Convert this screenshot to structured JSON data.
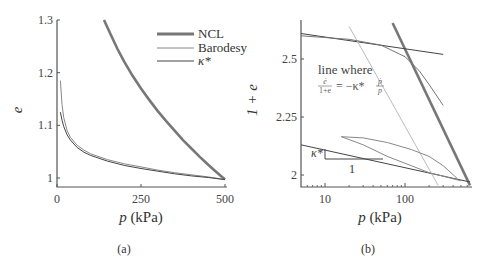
{
  "chart_data": [
    {
      "type": "line",
      "panel": "a",
      "caption": "(a)",
      "xlabel_var": "p",
      "xlabel_unit": " (kPa)",
      "ylabel": "e",
      "xlim": [
        0,
        500
      ],
      "ylim": [
        0.98,
        1.3
      ],
      "xticks": [
        0,
        250,
        500
      ],
      "xtick_labels": [
        "0",
        "250",
        "500"
      ],
      "yticks": [
        1.0,
        1.1,
        1.2,
        1.3
      ],
      "ytick_labels": [
        "1",
        "1.1",
        "1.2",
        "1.3"
      ],
      "legend": {
        "position": "top-right",
        "entries": [
          "NCL",
          "Barodesy",
          "κ*"
        ]
      },
      "series": [
        {
          "name": "NCL",
          "color": "#777777",
          "width": "thick",
          "x": [
            140,
            160,
            180,
            200,
            225,
            250,
            275,
            300,
            325,
            350,
            375,
            400,
            425,
            450,
            475,
            500
          ],
          "y": [
            1.3,
            1.272,
            1.245,
            1.221,
            1.194,
            1.17,
            1.148,
            1.127,
            1.108,
            1.09,
            1.072,
            1.056,
            1.04,
            1.025,
            1.011,
            0.997
          ]
        },
        {
          "name": "Barodesy",
          "color": "#888888",
          "width": "thin",
          "x": [
            10,
            15,
            20,
            30,
            40,
            60,
            80,
            100,
            150,
            200,
            250,
            300,
            350,
            400,
            450,
            500
          ],
          "y": [
            1.185,
            1.14,
            1.115,
            1.09,
            1.077,
            1.062,
            1.053,
            1.046,
            1.035,
            1.027,
            1.021,
            1.015,
            1.01,
            1.006,
            1.002,
            0.997
          ]
        },
        {
          "name": "κ*",
          "color": "#444444",
          "width": "thin",
          "x": [
            10,
            15,
            20,
            30,
            40,
            60,
            80,
            100,
            150,
            200,
            250,
            300,
            350,
            400,
            450,
            500
          ],
          "y": [
            1.125,
            1.11,
            1.098,
            1.082,
            1.072,
            1.058,
            1.049,
            1.043,
            1.032,
            1.024,
            1.018,
            1.013,
            1.008,
            1.004,
            1.001,
            0.997
          ]
        }
      ]
    },
    {
      "type": "line",
      "panel": "b",
      "caption": "(b)",
      "xlabel_var": "p",
      "xlabel_unit": " (kPa)",
      "ylabel": "1 + e",
      "xscale": "log",
      "xlim": [
        5,
        650
      ],
      "ylim": [
        1.95,
        2.65
      ],
      "xticks": [
        10,
        100
      ],
      "xtick_labels": [
        "10",
        "100"
      ],
      "yticks": [
        2.0,
        2.25,
        2.5
      ],
      "ytick_labels": [
        "2",
        "2.25",
        "2.5"
      ],
      "annotation": {
        "line1": "line where",
        "formula_num": "ė",
        "formula_den": "1+e",
        "formula_rhs": "= −κ*",
        "formula_rhs_num": "ṗ",
        "formula_rhs_den": "p"
      },
      "slope_triangle": {
        "vertical_label": "κ*",
        "horizontal_label": "1"
      },
      "series": [
        {
          "name": "NCL",
          "color": "#777777",
          "width": "thick",
          "x": [
            70,
            650
          ],
          "y": [
            2.655,
            1.955
          ]
        },
        {
          "name": "κ* upper",
          "color": "#444444",
          "width": "thin",
          "x": [
            5,
            300
          ],
          "y": [
            2.61,
            2.52
          ]
        },
        {
          "name": "κ* lower",
          "color": "#444444",
          "width": "thin",
          "x": [
            5,
            650
          ],
          "y": [
            2.13,
            1.97
          ]
        },
        {
          "name": "line where ė/(1+e) = −κ* ṗ/p",
          "color": "#bbbbbb",
          "width": "thin",
          "x": [
            20,
            260
          ],
          "y": [
            2.64,
            1.955
          ]
        },
        {
          "name": "Barodesy unloading",
          "color": "#777777",
          "width": "thin",
          "x": [
            5,
            20,
            50,
            100,
            150,
            200,
            300
          ],
          "y": [
            2.6,
            2.585,
            2.56,
            2.51,
            2.45,
            2.39,
            2.3
          ]
        },
        {
          "name": "Barodesy reload upper",
          "color": "#888888",
          "width": "thin",
          "x": [
            16,
            30,
            60,
            120,
            200,
            300,
            450
          ],
          "y": [
            2.165,
            2.16,
            2.14,
            2.11,
            2.08,
            2.04,
            1.985
          ]
        },
        {
          "name": "Barodesy reload lower",
          "color": "#888888",
          "width": "thin",
          "x": [
            16,
            30,
            60,
            120,
            200,
            300,
            500
          ],
          "y": [
            2.165,
            2.13,
            2.08,
            2.04,
            2.01,
            1.995,
            1.975
          ]
        }
      ]
    }
  ]
}
